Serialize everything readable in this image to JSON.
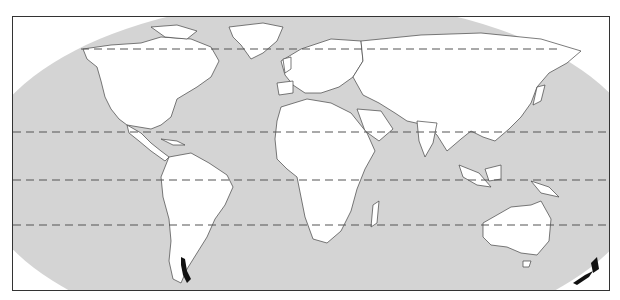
{
  "map": {
    "projection": "Robinson",
    "ocean_color": "#d4d4d4",
    "land_color": "#ffffff",
    "border_color": "#444444",
    "highlight_color": "#111111",
    "highlighted_regions": [
      "Chile (southern)",
      "New Zealand"
    ],
    "reference_lines": [
      {
        "name": "Arctic Circle",
        "style": "dashed"
      },
      {
        "name": "Tropic of Cancer",
        "style": "dashed"
      },
      {
        "name": "Equator",
        "style": "dashed"
      },
      {
        "name": "Tropic of Capricorn",
        "style": "dashed"
      }
    ]
  }
}
